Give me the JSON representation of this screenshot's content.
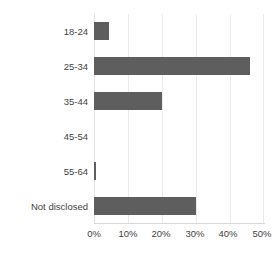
{
  "chart_data": {
    "type": "bar",
    "orientation": "horizontal",
    "title": "",
    "xlabel": "",
    "ylabel": "",
    "categories": [
      "18-24",
      "25-34",
      "35-44",
      "45-54",
      "55-64",
      "Not disclosed"
    ],
    "values": [
      4.5,
      46,
      20,
      0,
      0.6,
      30
    ],
    "value_suffix": "%",
    "xlim": [
      0,
      50
    ],
    "xticks": [
      0,
      10,
      20,
      30,
      40,
      50
    ],
    "xtick_labels": [
      "0%",
      "10%",
      "20%",
      "30%",
      "40%",
      "50%"
    ],
    "grid": "vertical",
    "legend": "none",
    "series": [
      {
        "name": "Share of respondents",
        "values": [
          4.5,
          46,
          20,
          0,
          0.6,
          30
        ]
      }
    ],
    "colors": {
      "bar_fill": "#5e5e5e",
      "gridline": "#eaeaea",
      "axis_line": "#d7d7d7",
      "text": "#3f3f3f",
      "background": "#ffffff"
    }
  }
}
